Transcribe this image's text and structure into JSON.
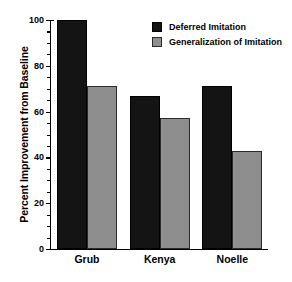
{
  "chart_data": {
    "type": "bar",
    "title": "",
    "subtitle": "",
    "xlabel": "",
    "ylabel": "Percent Improvement from Baseline",
    "categories": [
      "Grub",
      "Kenya",
      "Noelle"
    ],
    "series": [
      {
        "name": "Deferred Imitation",
        "color": "#141414",
        "values": [
          100,
          67,
          71
        ]
      },
      {
        "name": "Generalization of Imitation",
        "color": "#8e8e8e",
        "values": [
          71,
          57,
          43
        ]
      }
    ],
    "ylim": [
      0,
      100
    ],
    "ytick_labels": [
      "0",
      "20",
      "40",
      "60",
      "80",
      "100"
    ],
    "ytick_values": [
      0,
      20,
      40,
      60,
      80,
      100
    ],
    "yminor_step": 5,
    "grid": false,
    "legend_position": "top-right-inside",
    "spines": [
      "left",
      "bottom"
    ],
    "background_color": "#ffffff",
    "axis_color": "#000000"
  }
}
